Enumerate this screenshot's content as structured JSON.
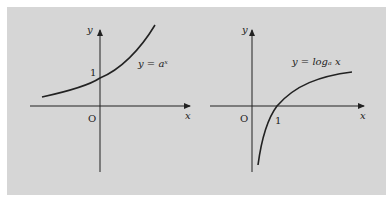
{
  "figure": {
    "left": {
      "function_label": "y = aˣ",
      "y_label": "y",
      "x_label": "x",
      "origin_label": "O",
      "tick_label": "1"
    },
    "right": {
      "function_label": "y = logₐ x",
      "y_label": "y",
      "x_label": "x",
      "origin_label": "O",
      "tick_label": "1"
    }
  },
  "colors": {
    "background": "#d6d6d6",
    "ink": "#222222"
  }
}
